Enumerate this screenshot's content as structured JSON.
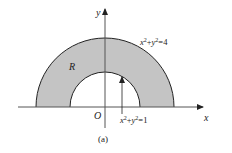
{
  "diagram": {
    "type": "polar-region",
    "region_label": "R",
    "outer_curve_label_parts": {
      "base1": "x",
      "exp1": "2",
      "plus": "+",
      "base2": "y",
      "exp2": "2",
      "rhs": "=4"
    },
    "inner_curve_label_parts": {
      "base1": "x",
      "exp1": "2",
      "plus": "+",
      "base2": "y",
      "exp2": "2",
      "rhs": "=1"
    },
    "outer_curve_label": "x²+y²=4",
    "inner_curve_label": "x²+y²=1",
    "x_axis_label": "x",
    "y_axis_label": "y",
    "origin_label": "O",
    "caption": "(a)",
    "colors": {
      "region_fill": "#c4c4c4",
      "stroke": "#222222",
      "background": "#ffffff"
    }
  }
}
